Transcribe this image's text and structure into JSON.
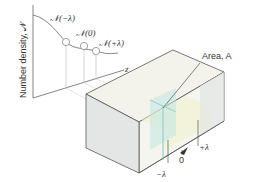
{
  "diagram": {
    "y_axis_label": "Number density, 𝒩",
    "z_axis_label": "z",
    "curve_points": [
      {
        "label": "𝒩(−λ)"
      },
      {
        "label": "𝒩(0)"
      },
      {
        "label": "𝒩(+λ)"
      }
    ],
    "area_label": "Area, A",
    "position_labels": {
      "minus": "−λ",
      "zero": "0",
      "plus": "+λ"
    },
    "colors": {
      "line": "#555555",
      "box_front": "#e6e8e8",
      "box_top": "#f3f3ec",
      "box_right": "#eef0ee",
      "plane": "#bfe6e2",
      "slab": "#f6f4d8"
    }
  }
}
